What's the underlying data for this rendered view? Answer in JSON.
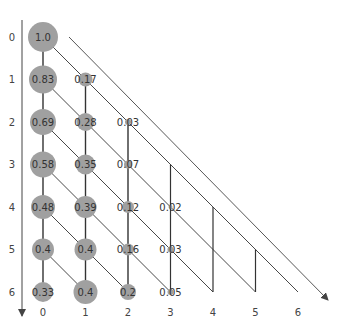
{
  "diagram": {
    "type": "lattice-triangle",
    "node_color": "#a0a0a0",
    "line_color": "#333333",
    "row_axis_labels": [
      "0",
      "1",
      "2",
      "3",
      "4",
      "5",
      "6"
    ],
    "col_axis_labels": [
      "0",
      "1",
      "2",
      "3",
      "4",
      "5",
      "6"
    ],
    "nodes": [
      {
        "row": 0,
        "col": 0,
        "value": "1.0",
        "r": 15
      },
      {
        "row": 1,
        "col": 0,
        "value": "0.83",
        "r": 14
      },
      {
        "row": 1,
        "col": 1,
        "value": "0.17",
        "r": 7
      },
      {
        "row": 2,
        "col": 0,
        "value": "0.69",
        "r": 13
      },
      {
        "row": 2,
        "col": 1,
        "value": "0.28",
        "r": 9
      },
      {
        "row": 2,
        "col": 2,
        "value": "0.03",
        "r": 3
      },
      {
        "row": 3,
        "col": 0,
        "value": "0.58",
        "r": 13
      },
      {
        "row": 3,
        "col": 1,
        "value": "0.35",
        "r": 10
      },
      {
        "row": 3,
        "col": 2,
        "value": "0.07",
        "r": 4
      },
      {
        "row": 4,
        "col": 0,
        "value": "0.48",
        "r": 12
      },
      {
        "row": 4,
        "col": 1,
        "value": "0.39",
        "r": 11
      },
      {
        "row": 4,
        "col": 2,
        "value": "0.12",
        "r": 6
      },
      {
        "row": 4,
        "col": 3,
        "value": "0.02",
        "r": 2
      },
      {
        "row": 5,
        "col": 0,
        "value": "0.4",
        "r": 11
      },
      {
        "row": 5,
        "col": 1,
        "value": "0.4",
        "r": 11
      },
      {
        "row": 5,
        "col": 2,
        "value": "0.16",
        "r": 6
      },
      {
        "row": 5,
        "col": 3,
        "value": "0.03",
        "r": 3
      },
      {
        "row": 6,
        "col": 0,
        "value": "0.33",
        "r": 10
      },
      {
        "row": 6,
        "col": 1,
        "value": "0.4",
        "r": 12
      },
      {
        "row": 6,
        "col": 2,
        "value": "0.2",
        "r": 8
      },
      {
        "row": 6,
        "col": 3,
        "value": "0.05",
        "r": 3
      }
    ]
  }
}
